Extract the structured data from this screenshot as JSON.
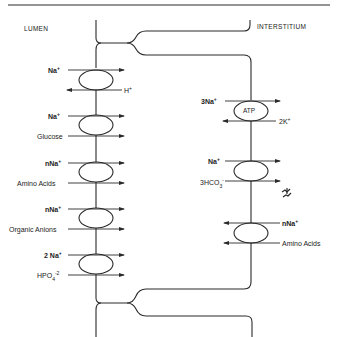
{
  "diagram": {
    "regions": {
      "lumen": "LUMEN",
      "interstitium": "INTERSTITIUM"
    },
    "apical_membrane": {
      "transporters": [
        {
          "name": "Na+/H+ exchanger",
          "labels": [
            "Na⁺",
            "H⁺"
          ],
          "directions": [
            "in",
            "out"
          ]
        },
        {
          "name": "Na+/glucose cotransporter",
          "labels": [
            "Na⁺",
            "Glucose"
          ],
          "directions": [
            "in",
            "in"
          ]
        },
        {
          "name": "Na+/amino acid cotransporter",
          "labels": [
            "nNa⁺",
            "Amino Acids"
          ],
          "directions": [
            "in",
            "in"
          ]
        },
        {
          "name": "Na+/organic anion cotransporter",
          "labels": [
            "nNa⁺",
            "Organic Anions"
          ],
          "directions": [
            "in",
            "in"
          ]
        },
        {
          "name": "Na+/phosphate cotransporter",
          "labels": [
            "2 Na⁺",
            "HPO₄⁻²"
          ],
          "directions": [
            "in",
            "in"
          ]
        }
      ]
    },
    "basolateral_membrane": {
      "transporters": [
        {
          "name": "Na+/K+ ATPase",
          "center_label": "ATP",
          "labels": [
            "3Na⁺",
            "2K⁺"
          ],
          "directions": [
            "out",
            "in"
          ]
        },
        {
          "name": "Na+/HCO3- cotransporter",
          "labels": [
            "Na⁺",
            "3HCO₃⁻"
          ],
          "directions": [
            "out",
            "out"
          ]
        },
        {
          "name": "Na+/amino acid cotransporter",
          "labels": [
            "nNa⁺",
            "Amino Acids"
          ],
          "directions": [
            "in",
            "in"
          ]
        }
      ]
    },
    "text": {
      "na": "Na",
      "nna": "nNa",
      "twona": "2 Na",
      "threena": "3Na",
      "plus": "+",
      "h": "H",
      "twok": "2K",
      "glucose": "Glucose",
      "amino_acids": "Amino Acids",
      "organic_anions": "Organic Anions",
      "hpo": "HPO",
      "hpo_sub": "4",
      "hpo_sup": "-2",
      "hco": "3HCO",
      "hco_sub": "3",
      "hco_sup": "-",
      "atp": "ATP"
    },
    "colors": {
      "line": "#2a2a2a",
      "background": "#ffffff"
    }
  }
}
